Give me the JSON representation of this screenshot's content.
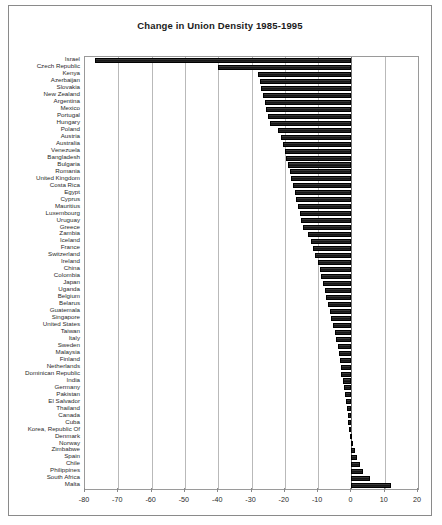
{
  "chart_data": {
    "type": "bar",
    "orientation": "horizontal",
    "title": "Change in Union Density 1985-1995",
    "xlabel": "",
    "ylabel": "",
    "xlim": [
      -80,
      20
    ],
    "xticks": [
      -80,
      -70,
      -60,
      -50,
      -40,
      -30,
      -20,
      -10,
      0,
      10,
      20
    ],
    "xtick_labels": [
      "-80",
      "-70",
      "-60",
      "-50",
      "-40",
      "-30",
      "-20",
      "-10",
      "0",
      "10",
      "20"
    ],
    "grid": true,
    "legend": false,
    "bar_color": "#1a1a1a",
    "categories": [
      "Israel",
      "Czech Republic",
      "Kenya",
      "Azerbaijan",
      "Slovakia",
      "New Zealand",
      "Argentina",
      "Mexico",
      "Portugal",
      "Hungary",
      "Poland",
      "Austria",
      "Australia",
      "Venezuela",
      "Bangladesh",
      "Bulgaria",
      "Romania",
      "United Kingdom",
      "Costa Rica",
      "Egypt",
      "Cyprus",
      "Mauritius",
      "Luxembourg",
      "Uruguay",
      "Greece",
      "Zambia",
      "Iceland",
      "France",
      "Switzerland",
      "Ireland",
      "China",
      "Colombia",
      "Japan",
      "Uganda",
      "Belgium",
      "Belarus",
      "Guatemala",
      "Singapore",
      "United States",
      "Taiwan",
      "Italy",
      "Sweden",
      "Malaysia",
      "Finland",
      "Netherlands",
      "Dominican Republic",
      "India",
      "Germany",
      "Pakistan",
      "El Salvador",
      "Thailand",
      "Canada",
      "Cuba",
      "Korea, Republic Of",
      "Denmark",
      "Norway",
      "Zimbabwe",
      "Spain",
      "Chile",
      "Philippines",
      "South Africa",
      "Malta"
    ],
    "values": [
      -77.0,
      -40.0,
      -28.0,
      -27.5,
      -27.0,
      -26.5,
      -26.0,
      -25.5,
      -25.0,
      -24.5,
      -22.0,
      -21.0,
      -20.5,
      -20.0,
      -19.5,
      -19.0,
      -18.5,
      -18.0,
      -17.5,
      -17.0,
      -16.5,
      -16.0,
      -15.5,
      -15.0,
      -14.5,
      -13.0,
      -12.0,
      -11.5,
      -11.0,
      -10.0,
      -9.5,
      -9.0,
      -8.5,
      -8.0,
      -7.5,
      -7.0,
      -6.5,
      -6.0,
      -5.5,
      -5.0,
      -4.5,
      -4.0,
      -3.8,
      -3.5,
      -3.2,
      -3.0,
      -2.6,
      -2.3,
      -2.0,
      -1.7,
      -1.4,
      -1.1,
      -0.9,
      -0.6,
      -0.3,
      0.5,
      1.0,
      1.8,
      2.5,
      3.5,
      5.5,
      12.0
    ]
  }
}
